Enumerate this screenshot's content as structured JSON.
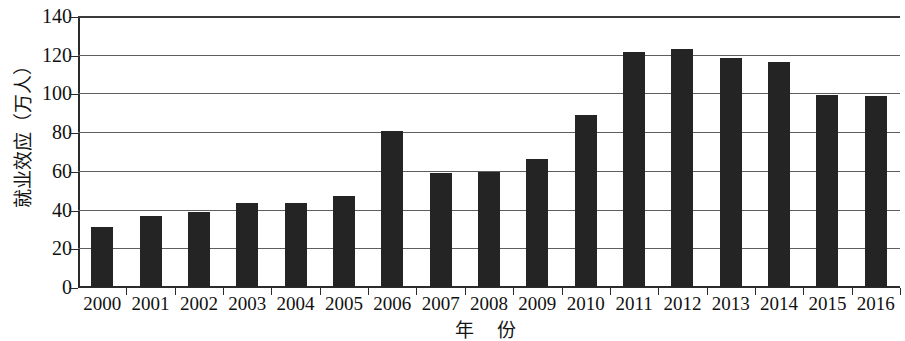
{
  "chart_data": {
    "type": "bar",
    "title": "",
    "xlabel": "年  份",
    "ylabel": "就业效应（万人）",
    "categories": [
      "2000",
      "2001",
      "2002",
      "2003",
      "2004",
      "2005",
      "2006",
      "2007",
      "2008",
      "2009",
      "2010",
      "2011",
      "2012",
      "2013",
      "2014",
      "2015",
      "2016"
    ],
    "values": [
      31,
      36.5,
      39,
      43.5,
      43.5,
      47,
      80.5,
      59,
      59.5,
      66,
      89,
      121.5,
      123,
      118.5,
      116,
      99,
      98.5
    ],
    "ylim": [
      0,
      140
    ],
    "yticks": [
      0,
      20,
      40,
      60,
      80,
      100,
      120,
      140
    ],
    "ytick_labels": [
      "0",
      "20",
      "40",
      "60",
      "80",
      "100",
      "120",
      "140"
    ],
    "grid": true,
    "grid_axis": "y",
    "legend": false,
    "legend_position": "none",
    "bar_color": "#242424",
    "grid_color": "#5e5e5e",
    "axis_color": "#2b2b2b",
    "background_color": "#ffffff"
  }
}
